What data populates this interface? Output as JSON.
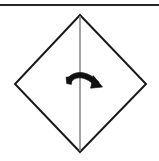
{
  "figure": {
    "background_color": "#ffffff",
    "width": 159,
    "height": 161
  },
  "separator": {
    "name": "top horizontal rule",
    "color": "#262626",
    "thickness": 2,
    "y": 4
  },
  "shape": {
    "name": "square rotated 45 degrees",
    "stroke_color": "#1a1a1a",
    "fill_color": "#ffffff",
    "stroke_width": 2,
    "vertices": {
      "top": [
        80,
        15
      ],
      "right": [
        146,
        84
      ],
      "bottom": [
        80,
        152
      ],
      "left": [
        15,
        84
      ]
    }
  },
  "crease": {
    "name": "vertical center crease line",
    "color": "#8c8c8c",
    "stroke_width": 1.6,
    "from": [
      80,
      15
    ],
    "to": [
      80,
      152
    ]
  },
  "arrow": {
    "name": "fold direction arrow",
    "direction": "right",
    "style": "curved solid arrow",
    "color": "#111111",
    "tail": [
      67,
      82
    ],
    "head": [
      101,
      86
    ],
    "crosses_crease": true
  },
  "labels": {
    "alt_text": "Fold the square in half along the vertical diagonal, folding right side over"
  }
}
